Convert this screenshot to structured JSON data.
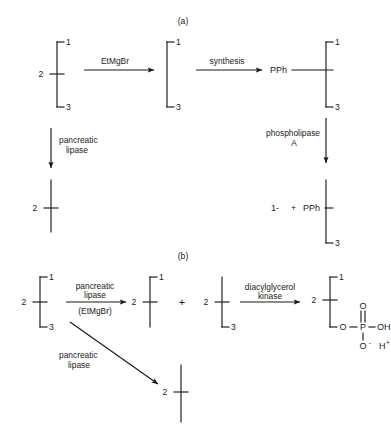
{
  "figure": {
    "panels": [
      {
        "id": "panel-a",
        "label": "(a)",
        "x": 183,
        "y": 24
      },
      {
        "id": "panel-b",
        "label": "(b)",
        "x": 183,
        "y": 259
      }
    ]
  },
  "positions": {
    "one": "1",
    "two": "2",
    "three": "3"
  },
  "panel_a": {
    "structure_1": {
      "pos1": "1",
      "pos2": "2",
      "pos3": "3"
    },
    "arrow_1": {
      "label": "EtMgBr"
    },
    "structure_2": {
      "pos1": "1",
      "pos3": "3"
    },
    "arrow_2": {
      "label": "synthesis"
    },
    "structure_3": {
      "pos1": "1",
      "pos2_group": "PPh",
      "pos3": "3"
    },
    "arrow_down_left": {
      "line1": "pancreatic",
      "line2": "lipase"
    },
    "arrow_down_right": {
      "line1": "phospholipase",
      "line2": "A"
    },
    "product_left": {
      "pos2": "2"
    },
    "product_right": {
      "released": "1-",
      "plus": "+",
      "group": "PPh",
      "pos3": "3"
    }
  },
  "panel_b": {
    "structure_1": {
      "pos1": "1",
      "pos2": "2",
      "pos3": "3"
    },
    "arrow_1": {
      "above": "pancreatic",
      "above2": "lipase",
      "below": "(EtMgBr)"
    },
    "structure_2": {
      "pos1": "1",
      "pos2": "2"
    },
    "plus_sign": "+",
    "structure_3": {
      "pos2": "2",
      "pos3": "3"
    },
    "arrow_2": {
      "above": "diacylglycerol",
      "above2": "kinase"
    },
    "structure_4": {
      "pos1": "1",
      "pos2": "2",
      "ester_o": "O",
      "p": "P",
      "double_o": "O",
      "hydroxyl": "OH",
      "anion_o": "O",
      "anion_charge": "-",
      "proton": "H",
      "proton_charge": "+"
    },
    "arrow_diagonal": {
      "line1": "pancreatic",
      "line2": "lipase"
    },
    "product_bottom": {
      "pos2": "2"
    }
  },
  "colors": {
    "ink": "#1a1a1a",
    "background": "#ffffff"
  }
}
